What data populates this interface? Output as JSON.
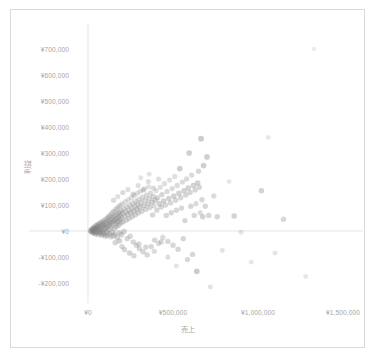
{
  "chart_data": {
    "type": "scatter",
    "title": "",
    "xlabel": "売上",
    "ylabel": "利益",
    "xlim": [
      -120000,
      1700000
    ],
    "ylim": [
      -260000,
      760000
    ],
    "grid": true,
    "legend": "none",
    "marker": {
      "shape": "circle",
      "color": "#7f7f7f",
      "opacity_range": [
        0.12,
        0.75
      ],
      "size_px_range": [
        2.2,
        3.4
      ]
    },
    "axis_color": "#d9d9d9",
    "tick_label_color": "#a6a6a6",
    "xticks": [
      {
        "value": 0,
        "label": "¥0"
      },
      {
        "value": 500000,
        "label": "¥500,000"
      },
      {
        "value": 1000000,
        "label": "¥1,000,000"
      },
      {
        "value": 1500000,
        "label": "¥1,500,000"
      }
    ],
    "yticks": [
      {
        "value": 700000,
        "label": "¥700,000"
      },
      {
        "value": 600000,
        "label": "¥600,000"
      },
      {
        "value": 500000,
        "label": "¥500,000"
      },
      {
        "value": 400000,
        "label": "¥400,000"
      },
      {
        "value": 300000,
        "label": "¥300,000"
      },
      {
        "value": 200000,
        "label": "¥200,000"
      },
      {
        "value": 100000,
        "label": "¥100,000"
      },
      {
        "value": 0,
        "label": "¥0"
      },
      {
        "value": -100000,
        "label": "-¥100,000"
      },
      {
        "value": -200000,
        "label": "-¥200,000"
      }
    ],
    "points": [
      [
        14000,
        2000,
        0.5
      ],
      [
        18000,
        -3000,
        0.5
      ],
      [
        21000,
        6000,
        0.45
      ],
      [
        23000,
        -1000,
        0.6
      ],
      [
        26000,
        9000,
        0.5
      ],
      [
        28000,
        -6000,
        0.5
      ],
      [
        30000,
        3000,
        0.55
      ],
      [
        32000,
        12000,
        0.5
      ],
      [
        34000,
        -9000,
        0.5
      ],
      [
        36000,
        5000,
        0.6
      ],
      [
        38000,
        16000,
        0.5
      ],
      [
        40000,
        -2000,
        0.55
      ],
      [
        42000,
        10000,
        0.5
      ],
      [
        44000,
        -12000,
        0.5
      ],
      [
        46000,
        20000,
        0.5
      ],
      [
        48000,
        4000,
        0.6
      ],
      [
        50000,
        -5000,
        0.55
      ],
      [
        52000,
        14000,
        0.5
      ],
      [
        54000,
        24000,
        0.5
      ],
      [
        56000,
        -8000,
        0.5
      ],
      [
        58000,
        7000,
        0.6
      ],
      [
        60000,
        18000,
        0.5
      ],
      [
        62000,
        -14000,
        0.5
      ],
      [
        64000,
        28000,
        0.5
      ],
      [
        66000,
        2000,
        0.55
      ],
      [
        68000,
        11000,
        0.5
      ],
      [
        70000,
        -4000,
        0.6
      ],
      [
        72000,
        22000,
        0.5
      ],
      [
        74000,
        33000,
        0.5
      ],
      [
        76000,
        -10000,
        0.5
      ],
      [
        78000,
        6000,
        0.55
      ],
      [
        80000,
        15000,
        0.5
      ],
      [
        82000,
        -17000,
        0.5
      ],
      [
        84000,
        26000,
        0.6
      ],
      [
        86000,
        38000,
        0.5
      ],
      [
        88000,
        1000,
        0.5
      ],
      [
        90000,
        -7000,
        0.55
      ],
      [
        92000,
        19000,
        0.5
      ],
      [
        94000,
        31000,
        0.5
      ],
      [
        96000,
        -13000,
        0.5
      ],
      [
        98000,
        8000,
        0.6
      ],
      [
        100000,
        43000,
        0.5
      ],
      [
        102000,
        23000,
        0.5
      ],
      [
        104000,
        -20000,
        0.5
      ],
      [
        106000,
        12000,
        0.55
      ],
      [
        108000,
        35000,
        0.5
      ],
      [
        110000,
        -3000,
        0.6
      ],
      [
        112000,
        48000,
        0.5
      ],
      [
        114000,
        17000,
        0.5
      ],
      [
        116000,
        -16000,
        0.5
      ],
      [
        118000,
        27000,
        0.55
      ],
      [
        120000,
        55000,
        0.5
      ],
      [
        122000,
        5000,
        0.5
      ],
      [
        124000,
        39000,
        0.6
      ],
      [
        126000,
        -9000,
        0.5
      ],
      [
        128000,
        21000,
        0.5
      ],
      [
        130000,
        60000,
        0.5
      ],
      [
        132000,
        32000,
        0.55
      ],
      [
        134000,
        -22000,
        0.5
      ],
      [
        136000,
        13000,
        0.5
      ],
      [
        138000,
        45000,
        0.6
      ],
      [
        140000,
        68000,
        0.5
      ],
      [
        142000,
        -5000,
        0.5
      ],
      [
        144000,
        25000,
        0.5
      ],
      [
        146000,
        52000,
        0.55
      ],
      [
        148000,
        36000,
        0.5
      ],
      [
        150000,
        -18000,
        0.6
      ],
      [
        152000,
        75000,
        0.5
      ],
      [
        154000,
        9000,
        0.5
      ],
      [
        156000,
        41000,
        0.5
      ],
      [
        158000,
        58000,
        0.55
      ],
      [
        160000,
        -11000,
        0.5
      ],
      [
        162000,
        29000,
        0.6
      ],
      [
        164000,
        83000,
        0.5
      ],
      [
        166000,
        47000,
        0.5
      ],
      [
        168000,
        16000,
        0.5
      ],
      [
        170000,
        64000,
        0.55
      ],
      [
        172000,
        -25000,
        0.5
      ],
      [
        174000,
        37000,
        0.6
      ],
      [
        176000,
        91000,
        0.5
      ],
      [
        178000,
        53000,
        0.5
      ],
      [
        180000,
        22000,
        0.5
      ],
      [
        182000,
        70000,
        0.55
      ],
      [
        184000,
        -7000,
        0.5
      ],
      [
        186000,
        44000,
        0.6
      ],
      [
        188000,
        98000,
        0.45
      ],
      [
        190000,
        61000,
        0.5
      ],
      [
        192000,
        30000,
        0.5
      ],
      [
        194000,
        78000,
        0.5
      ],
      [
        196000,
        -14000,
        0.55
      ],
      [
        198000,
        50000,
        0.5
      ],
      [
        200000,
        105000,
        0.4
      ],
      [
        203000,
        68000,
        0.5
      ],
      [
        206000,
        35000,
        0.5
      ],
      [
        209000,
        86000,
        0.45
      ],
      [
        212000,
        -2000,
        0.55
      ],
      [
        215000,
        57000,
        0.5
      ],
      [
        218000,
        112000,
        0.4
      ],
      [
        221000,
        74000,
        0.5
      ],
      [
        224000,
        41000,
        0.5
      ],
      [
        227000,
        93000,
        0.45
      ],
      [
        230000,
        -30000,
        0.5
      ],
      [
        233000,
        63000,
        0.55
      ],
      [
        236000,
        120000,
        0.4
      ],
      [
        239000,
        81000,
        0.5
      ],
      [
        242000,
        48000,
        0.5
      ],
      [
        245000,
        100000,
        0.45
      ],
      [
        248000,
        -20000,
        0.5
      ],
      [
        251000,
        70000,
        0.55
      ],
      [
        254000,
        128000,
        0.4
      ],
      [
        257000,
        88000,
        0.5
      ],
      [
        260000,
        55000,
        0.5
      ],
      [
        263000,
        107000,
        0.45
      ],
      [
        266000,
        -42000,
        0.5
      ],
      [
        269000,
        76000,
        0.55
      ],
      [
        272000,
        136000,
        0.4
      ],
      [
        275000,
        95000,
        0.5
      ],
      [
        278000,
        62000,
        0.5
      ],
      [
        281000,
        114000,
        0.45
      ],
      [
        284000,
        -55000,
        0.5
      ],
      [
        287000,
        83000,
        0.55
      ],
      [
        290000,
        145000,
        0.4
      ],
      [
        293000,
        102000,
        0.5
      ],
      [
        296000,
        69000,
        0.5
      ],
      [
        299000,
        122000,
        0.45
      ],
      [
        302000,
        -68000,
        0.5
      ],
      [
        305000,
        90000,
        0.55
      ],
      [
        308000,
        153000,
        0.4
      ],
      [
        312000,
        110000,
        0.5
      ],
      [
        316000,
        76000,
        0.5
      ],
      [
        320000,
        130000,
        0.45
      ],
      [
        324000,
        -80000,
        0.5
      ],
      [
        328000,
        97000,
        0.55
      ],
      [
        332000,
        162000,
        0.4
      ],
      [
        336000,
        118000,
        0.5
      ],
      [
        340000,
        83000,
        0.5
      ],
      [
        344000,
        138000,
        0.45
      ],
      [
        348000,
        -92000,
        0.5
      ],
      [
        352000,
        104000,
        0.55
      ],
      [
        356000,
        170000,
        0.4
      ],
      [
        360000,
        125000,
        0.5
      ],
      [
        364000,
        90000,
        0.5
      ],
      [
        368000,
        146000,
        0.45
      ],
      [
        372000,
        -60000,
        0.5
      ],
      [
        376000,
        111000,
        0.55
      ],
      [
        380000,
        62000,
        0.5
      ],
      [
        384000,
        133000,
        0.5
      ],
      [
        388000,
        97000,
        0.45
      ],
      [
        392000,
        -35000,
        0.5
      ],
      [
        396000,
        118000,
        0.55
      ],
      [
        400000,
        155000,
        0.4
      ],
      [
        405000,
        80000,
        0.5
      ],
      [
        410000,
        128000,
        0.5
      ],
      [
        415000,
        -48000,
        0.45
      ],
      [
        420000,
        105000,
        0.55
      ],
      [
        425000,
        168000,
        0.4
      ],
      [
        430000,
        92000,
        0.5
      ],
      [
        435000,
        140000,
        0.5
      ],
      [
        440000,
        -25000,
        0.45
      ],
      [
        445000,
        115000,
        0.55
      ],
      [
        450000,
        182000,
        0.4
      ],
      [
        455000,
        100000,
        0.5
      ],
      [
        460000,
        60000,
        0.5
      ],
      [
        465000,
        152000,
        0.45
      ],
      [
        470000,
        -40000,
        0.5
      ],
      [
        475000,
        125000,
        0.55
      ],
      [
        480000,
        196000,
        0.4
      ],
      [
        485000,
        108000,
        0.5
      ],
      [
        490000,
        70000,
        0.5
      ],
      [
        495000,
        163000,
        0.45
      ],
      [
        500000,
        -55000,
        0.5
      ],
      [
        505000,
        135000,
        0.55
      ],
      [
        510000,
        210000,
        0.4
      ],
      [
        515000,
        118000,
        0.5
      ],
      [
        520000,
        80000,
        0.5
      ],
      [
        525000,
        175000,
        0.45
      ],
      [
        530000,
        -70000,
        0.5
      ],
      [
        535000,
        145000,
        0.55
      ],
      [
        540000,
        240000,
        0.6
      ],
      [
        545000,
        128000,
        0.5
      ],
      [
        550000,
        88000,
        0.5
      ],
      [
        555000,
        188000,
        0.45
      ],
      [
        560000,
        -30000,
        0.5
      ],
      [
        565000,
        155000,
        0.55
      ],
      [
        570000,
        40000,
        0.5
      ],
      [
        575000,
        138000,
        0.5
      ],
      [
        580000,
        200000,
        0.45
      ],
      [
        585000,
        -110000,
        0.5
      ],
      [
        590000,
        165000,
        0.55
      ],
      [
        595000,
        300000,
        0.6
      ],
      [
        600000,
        148000,
        0.5
      ],
      [
        605000,
        95000,
        0.5
      ],
      [
        610000,
        215000,
        0.45
      ],
      [
        615000,
        -90000,
        0.5
      ],
      [
        620000,
        175000,
        0.55
      ],
      [
        625000,
        60000,
        0.5
      ],
      [
        630000,
        158000,
        0.5
      ],
      [
        635000,
        105000,
        0.45
      ],
      [
        640000,
        -155000,
        0.65
      ],
      [
        645000,
        185000,
        0.55
      ],
      [
        650000,
        230000,
        0.5
      ],
      [
        655000,
        168000,
        0.5
      ],
      [
        660000,
        70000,
        0.45
      ],
      [
        665000,
        355000,
        0.65
      ],
      [
        670000,
        120000,
        0.5
      ],
      [
        675000,
        55000,
        0.55
      ],
      [
        680000,
        252000,
        0.6
      ],
      [
        690000,
        95000,
        0.5
      ],
      [
        700000,
        285000,
        0.6
      ],
      [
        710000,
        60000,
        0.5
      ],
      [
        720000,
        -215000,
        0.35
      ],
      [
        740000,
        135000,
        0.45
      ],
      [
        760000,
        55000,
        0.5
      ],
      [
        790000,
        -75000,
        0.35
      ],
      [
        830000,
        190000,
        0.3
      ],
      [
        860000,
        58000,
        0.55
      ],
      [
        900000,
        -5000,
        0.35
      ],
      [
        960000,
        -120000,
        0.3
      ],
      [
        1020000,
        155000,
        0.55
      ],
      [
        1060000,
        360000,
        0.3
      ],
      [
        1100000,
        -85000,
        0.35
      ],
      [
        1150000,
        45000,
        0.5
      ],
      [
        1280000,
        -175000,
        0.3
      ],
      [
        1330000,
        700000,
        0.25
      ],
      [
        200000,
        -60000,
        0.5
      ],
      [
        215000,
        -72000,
        0.5
      ],
      [
        245000,
        -85000,
        0.55
      ],
      [
        270000,
        -95000,
        0.5
      ],
      [
        160000,
        -45000,
        0.5
      ],
      [
        185000,
        -38000,
        0.55
      ],
      [
        300000,
        -50000,
        0.45
      ],
      [
        340000,
        -62000,
        0.5
      ],
      [
        390000,
        -78000,
        0.45
      ],
      [
        430000,
        -42000,
        0.5
      ],
      [
        470000,
        -100000,
        0.4
      ],
      [
        520000,
        -135000,
        0.35
      ],
      [
        150000,
        118000,
        0.45
      ],
      [
        175000,
        132000,
        0.4
      ],
      [
        205000,
        148000,
        0.45
      ],
      [
        235000,
        160000,
        0.4
      ],
      [
        265000,
        142000,
        0.45
      ],
      [
        295000,
        175000,
        0.4
      ],
      [
        325000,
        158000,
        0.45
      ],
      [
        355000,
        190000,
        0.4
      ],
      [
        385000,
        165000,
        0.45
      ],
      [
        415000,
        200000,
        0.4
      ],
      [
        310000,
        205000,
        0.35
      ],
      [
        360000,
        218000,
        0.35
      ]
    ]
  },
  "axis_titles": {
    "x": "売上",
    "y": "利益"
  }
}
